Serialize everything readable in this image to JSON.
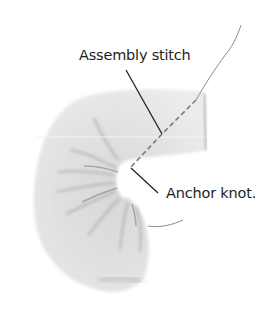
{
  "figure": {
    "labels": {
      "assembly_stitch": "Assembly stitch",
      "anchor_knot": "Anchor knot."
    },
    "colors": {
      "background": "#ffffff",
      "fabric_light": "#e6e6e6",
      "fabric_mid": "#d2d2d2",
      "fabric_shadow": "#9a9a9a",
      "thread": "#8c8c8c",
      "leader_line": "#1e1e1e",
      "text": "#1e1e1e"
    }
  }
}
